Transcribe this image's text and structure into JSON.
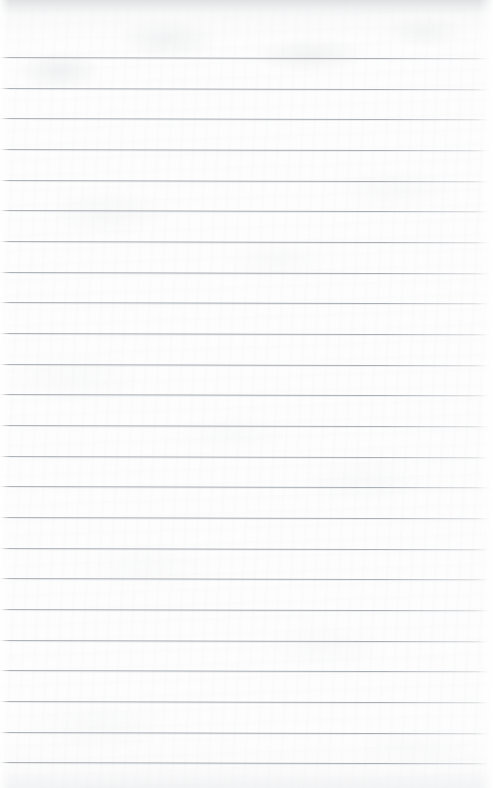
{
  "document": {
    "kind": "scanned-ruled-notebook-paper",
    "content_text": "",
    "page_width_px": 493,
    "page_height_px": 788
  },
  "paper": {
    "background_color": "#fdfdfd",
    "edge_shadow_color": "#e9eaeb",
    "texture": "subtle-mottled-fibre"
  },
  "ruling": {
    "line_color": "#a6abb1",
    "line_thickness_px": 1,
    "line_spacing_px": 30.7,
    "first_line_y_px": 57,
    "line_count": 23,
    "left_inset_px": 0,
    "right_inset_px": 4,
    "skew_degrees": 0.16,
    "has_vertical_margin_rule": false,
    "line_y_positions": [
      57,
      88,
      118,
      149,
      180,
      210,
      241,
      272,
      302,
      333,
      364,
      394,
      425,
      456,
      486,
      517,
      548,
      578,
      609,
      640,
      670,
      701,
      732,
      762
    ]
  },
  "regions": {
    "top_margin_label": "",
    "top_margin_height_px": 56,
    "writing_area_label": ""
  }
}
